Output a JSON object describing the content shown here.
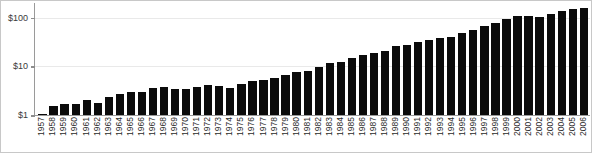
{
  "chart_data": {
    "type": "bar",
    "title": "",
    "subtitle": "",
    "xlabel": "",
    "ylabel": "",
    "yscale": "log",
    "ylim": [
      1,
      200
    ],
    "grid": true,
    "legend": null,
    "ytick_labels": [
      "$100",
      "$10",
      "$1"
    ],
    "ytick_values": [
      100,
      10,
      1
    ],
    "categories": [
      "1957",
      "1958",
      "1959",
      "1960",
      "1961",
      "1962",
      "1963",
      "1964",
      "1965",
      "1966",
      "1967",
      "1968",
      "1969",
      "1970",
      "1971",
      "1972",
      "1973",
      "1974",
      "1975",
      "1976",
      "1977",
      "1978",
      "1979",
      "1980",
      "1981",
      "1982",
      "1983",
      "1984",
      "1985",
      "1986",
      "1987",
      "1988",
      "1989",
      "1990",
      "1991",
      "1992",
      "1993",
      "1994",
      "1995",
      "1996",
      "1997",
      "1998",
      "1999",
      "2000",
      "2001",
      "2002",
      "2003",
      "2004",
      "2005",
      "2006"
    ],
    "values": [
      1.05,
      1.5,
      1.7,
      1.7,
      2.0,
      1.8,
      2.4,
      2.7,
      3.0,
      3.0,
      3.6,
      3.8,
      3.5,
      3.5,
      3.8,
      4.2,
      3.9,
      3.6,
      4.3,
      5.0,
      5.3,
      5.8,
      6.6,
      7.6,
      8.2,
      9.5,
      11.5,
      12.5,
      15.0,
      17.5,
      19.0,
      21.0,
      26.0,
      27.0,
      32.0,
      35.0,
      38.0,
      40.0,
      48.0,
      56.0,
      66.0,
      78.0,
      92.0,
      110.0,
      108.0,
      105.0,
      118.0,
      135.0,
      150.0,
      160.0
    ]
  }
}
